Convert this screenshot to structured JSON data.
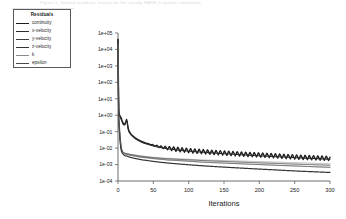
{
  "header": {
    "faint_title_text": "Figure 1.  Scaled residuals history for the steady RANS k-epsilon simulation",
    "rule_name": "faint-underline"
  },
  "legend": {
    "title": "Residuals",
    "items": [
      {
        "label": "continuity",
        "color": "#1c1c1c",
        "width": 1.35
      },
      {
        "label": "x-velocity",
        "color": "#2a2a2a",
        "width": 1.2
      },
      {
        "label": "y-velocity",
        "color": "#3d3d3d",
        "width": 1.0
      },
      {
        "label": "z-velocity",
        "color": "#343434",
        "width": 1.25
      },
      {
        "label": "k",
        "color": "#8a8a8a",
        "width": 0.65
      },
      {
        "label": "epsilon",
        "color": "#4a4a4a",
        "width": 1.0
      }
    ]
  },
  "chart_data": {
    "type": "line",
    "title": "",
    "xlabel": "Iterations",
    "ylabel": "",
    "yscale": "log",
    "xlim": [
      0,
      300
    ],
    "ylim": [
      0.0001,
      100000
    ],
    "grid": false,
    "legend_position": "top-left",
    "xticks": [
      0,
      50,
      100,
      150,
      200,
      250,
      300
    ],
    "xtick_labels": [
      "0",
      "50",
      "100",
      "150",
      "200",
      "250",
      "300"
    ],
    "yticks": [
      100000,
      10000,
      1000,
      100,
      10,
      1,
      0.1,
      0.01,
      0.001,
      0.0001
    ],
    "ytick_labels": [
      "1e+05",
      "1e+04",
      "1e+03",
      "1e+02",
      "1e+01",
      "1e+00",
      "1e-01",
      "1e-02",
      "1e-03",
      "1e-04"
    ],
    "x": [
      0,
      1,
      2,
      3,
      4,
      5,
      6,
      7,
      8,
      9,
      10,
      11,
      12,
      13,
      14,
      15,
      16,
      18,
      20,
      25,
      30,
      35,
      40,
      50,
      60,
      70,
      80,
      90,
      100,
      120,
      140,
      160,
      180,
      200,
      220,
      240,
      260,
      280,
      300
    ],
    "series": [
      {
        "name": "continuity",
        "color": "#1c1c1c",
        "width": 1.35,
        "oscillating": true,
        "osc_start": 40,
        "osc_period": 6,
        "osc_amp_decades": 0.28,
        "values": [
          40000,
          2.0,
          1.1,
          0.9,
          0.75,
          0.6,
          0.45,
          0.35,
          0.3,
          0.28,
          0.3,
          0.4,
          0.55,
          0.42,
          0.2,
          0.13,
          0.1,
          0.075,
          0.06,
          0.04,
          0.03,
          0.024,
          0.02,
          0.015,
          0.012,
          0.0102,
          0.009,
          0.008,
          0.0072,
          0.0062,
          0.0054,
          0.0048,
          0.0043,
          0.0039,
          0.0035,
          0.0031,
          0.0028,
          0.0026,
          0.0024
        ]
      },
      {
        "name": "x-velocity",
        "color": "#2a2a2a",
        "width": 1.1,
        "oscillating": false,
        "values": [
          40000,
          1.6,
          0.95,
          0.78,
          0.62,
          0.5,
          0.38,
          0.3,
          0.26,
          0.25,
          0.27,
          0.36,
          0.5,
          0.38,
          0.17,
          0.115,
          0.09,
          0.068,
          0.055,
          0.036,
          0.027,
          0.021,
          0.018,
          0.0135,
          0.0108,
          0.0092,
          0.0081,
          0.0072,
          0.0065,
          0.0056,
          0.0049,
          0.0043,
          0.0038,
          0.0034,
          0.0031,
          0.0028,
          0.0025,
          0.0023,
          0.0021
        ]
      },
      {
        "name": "y-velocity",
        "color": "#3d3d3d",
        "width": 0.95,
        "oscillating": false,
        "values": [
          30000,
          0.6,
          0.12,
          0.03,
          0.012,
          0.0075,
          0.006,
          0.0053,
          0.0049,
          0.0046,
          0.0044,
          0.0043,
          0.0042,
          0.0041,
          0.004,
          0.0039,
          0.0038,
          0.0036,
          0.0035,
          0.0032,
          0.0029,
          0.0027,
          0.0026,
          0.0023,
          0.0021,
          0.0019,
          0.0018,
          0.0017,
          0.0016,
          0.0014,
          0.00128,
          0.00118,
          0.00108,
          0.001,
          0.00092,
          0.00085,
          0.00079,
          0.00073,
          0.00068
        ]
      },
      {
        "name": "z-velocity",
        "color": "#343434",
        "width": 1.2,
        "oscillating": false,
        "values": [
          30000,
          0.55,
          0.1,
          0.025,
          0.01,
          0.0062,
          0.005,
          0.0044,
          0.004,
          0.0037,
          0.0035,
          0.0034,
          0.0033,
          0.0032,
          0.0031,
          0.003,
          0.0029,
          0.0027,
          0.0026,
          0.0023,
          0.0021,
          0.0019,
          0.0018,
          0.00155,
          0.00138,
          0.00125,
          0.00114,
          0.00105,
          0.00097,
          0.00084,
          0.00074,
          0.00066,
          0.00059,
          0.00053,
          0.00048,
          0.00043,
          0.00039,
          0.00036,
          0.00033
        ]
      },
      {
        "name": "k",
        "color": "#8a8a8a",
        "width": 0.6,
        "oscillating": false,
        "values": [
          20000,
          0.9,
          0.25,
          0.06,
          0.02,
          0.01,
          0.0072,
          0.006,
          0.0055,
          0.0052,
          0.005,
          0.0049,
          0.0048,
          0.0047,
          0.0046,
          0.0045,
          0.0044,
          0.0042,
          0.0041,
          0.0038,
          0.0035,
          0.0033,
          0.0031,
          0.0028,
          0.0026,
          0.0024,
          0.0023,
          0.0022,
          0.0021,
          0.0019,
          0.0018,
          0.0017,
          0.0016,
          0.0015,
          0.00142,
          0.00134,
          0.00126,
          0.00119,
          0.00112
        ]
      },
      {
        "name": "epsilon",
        "color": "#4a4a4a",
        "width": 0.95,
        "oscillating": false,
        "values": [
          25000,
          0.8,
          0.2,
          0.05,
          0.018,
          0.0095,
          0.0068,
          0.0058,
          0.0053,
          0.005,
          0.0048,
          0.0047,
          0.0046,
          0.0045,
          0.0044,
          0.0043,
          0.0042,
          0.004,
          0.0039,
          0.0036,
          0.0033,
          0.0031,
          0.0029,
          0.0026,
          0.0024,
          0.00225,
          0.00213,
          0.00202,
          0.00192,
          0.00175,
          0.0016,
          0.00148,
          0.00137,
          0.00127,
          0.00118,
          0.0011,
          0.00103,
          0.00097,
          0.00091
        ]
      }
    ]
  }
}
